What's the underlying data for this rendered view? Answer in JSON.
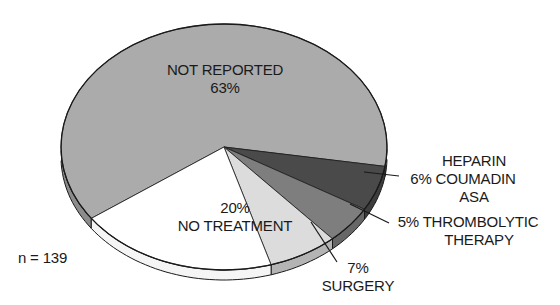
{
  "chart_data": {
    "type": "pie",
    "style": "3d-tilted",
    "title": "",
    "sample_size_label": "n = 139",
    "slices": [
      {
        "label": "NOT REPORTED",
        "value": 63,
        "display": "63%",
        "color": "#ababab"
      },
      {
        "label": "HEPARIN COUMADIN ASA",
        "value": 6,
        "display": "6%",
        "color": "#4a4a4a"
      },
      {
        "label": "THROMBOLYTIC THERAPY",
        "value": 5,
        "display": "5%",
        "color": "#7e7e7e"
      },
      {
        "label": "SURGERY",
        "value": 7,
        "display": "7%",
        "color": "#dcdcdc"
      },
      {
        "label": "NO TREATMENT",
        "value": 20,
        "display": "20%",
        "color": "#ffffff"
      }
    ]
  },
  "labels": {
    "not_reported_name": "NOT REPORTED",
    "not_reported_pct": "63%",
    "heparin_line1": "HEPARIN",
    "heparin_line2": "6% COUMADIN",
    "heparin_line3": "ASA",
    "thrombolytic_line1": "5% THROMBOLYTIC",
    "thrombolytic_line2": "THERAPY",
    "surgery_pct": "7%",
    "surgery_name": "SURGERY",
    "no_treatment_pct": "20%",
    "no_treatment_name": "NO TREATMENT",
    "n_label": "n = 139"
  }
}
